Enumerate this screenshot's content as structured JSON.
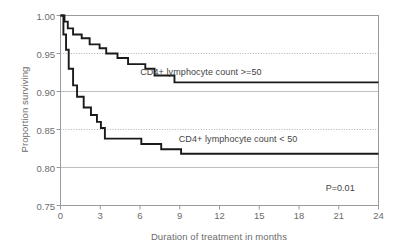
{
  "chart_data": {
    "type": "line",
    "subtype": "kaplan-meier-step",
    "title": "",
    "xlabel": "Duration of treatment in months",
    "ylabel": "Proportion surviving",
    "xlim": [
      0,
      24
    ],
    "ylim": [
      0.75,
      1.0
    ],
    "xticks": [
      0,
      3,
      6,
      9,
      12,
      15,
      18,
      21,
      24
    ],
    "xticklabels": [
      "0",
      "3",
      "6",
      "9",
      "12",
      "15",
      "18",
      "21",
      "24"
    ],
    "yticks": [
      0.75,
      0.8,
      0.85,
      0.9,
      0.95,
      1.0
    ],
    "yticklabels": [
      "0.75",
      "0.80",
      "0.85",
      "0.90",
      "0.95",
      "1.00"
    ],
    "grid": "horizontal-dotted",
    "legend_position": "inline-right-of-curve",
    "annotations": [
      {
        "name": "p-value",
        "text": "P=0.01",
        "x": 22.2,
        "y": 0.772
      }
    ],
    "series": [
      {
        "name": "CD4+ lymphocyte count >=50",
        "label": "CD4+ lymphocyte count >=50",
        "color": "#1a1a1a",
        "label_x": 10.6,
        "label_y": 0.925,
        "points": [
          [
            0.0,
            1.0
          ],
          [
            0.3,
            1.0
          ],
          [
            0.3,
            0.992
          ],
          [
            0.55,
            0.992
          ],
          [
            0.55,
            0.983
          ],
          [
            0.95,
            0.983
          ],
          [
            0.95,
            0.975
          ],
          [
            1.6,
            0.975
          ],
          [
            1.6,
            0.97
          ],
          [
            2.2,
            0.97
          ],
          [
            2.2,
            0.962
          ],
          [
            2.95,
            0.962
          ],
          [
            2.95,
            0.957
          ],
          [
            3.45,
            0.957
          ],
          [
            3.45,
            0.95
          ],
          [
            4.3,
            0.95
          ],
          [
            4.3,
            0.944
          ],
          [
            5.1,
            0.944
          ],
          [
            5.1,
            0.936
          ],
          [
            6.4,
            0.936
          ],
          [
            6.4,
            0.93
          ],
          [
            7.1,
            0.93
          ],
          [
            7.1,
            0.921
          ],
          [
            8.6,
            0.921
          ],
          [
            8.6,
            0.912
          ],
          [
            24.0,
            0.912
          ]
        ]
      },
      {
        "name": "CD4+ lymphocyte count < 50",
        "label": "CD4+ lymphocyte count < 50",
        "color": "#1a1a1a",
        "label_x": 13.4,
        "label_y": 0.836,
        "points": [
          [
            0.0,
            1.0
          ],
          [
            0.22,
            1.0
          ],
          [
            0.22,
            0.975
          ],
          [
            0.42,
            0.975
          ],
          [
            0.42,
            0.955
          ],
          [
            0.62,
            0.955
          ],
          [
            0.62,
            0.93
          ],
          [
            0.95,
            0.93
          ],
          [
            0.95,
            0.908
          ],
          [
            1.25,
            0.908
          ],
          [
            1.25,
            0.893
          ],
          [
            1.75,
            0.893
          ],
          [
            1.75,
            0.879
          ],
          [
            2.3,
            0.879
          ],
          [
            2.3,
            0.869
          ],
          [
            2.75,
            0.869
          ],
          [
            2.75,
            0.86
          ],
          [
            3.05,
            0.86
          ],
          [
            3.05,
            0.852
          ],
          [
            3.35,
            0.852
          ],
          [
            3.35,
            0.838
          ],
          [
            6.1,
            0.838
          ],
          [
            6.1,
            0.831
          ],
          [
            7.6,
            0.831
          ],
          [
            7.6,
            0.824
          ],
          [
            9.1,
            0.824
          ],
          [
            9.1,
            0.818
          ],
          [
            24.0,
            0.818
          ]
        ]
      }
    ]
  },
  "axes": {
    "y_label": "Proportion surviving",
    "x_label": "Duration of treatment in months"
  },
  "labels": {
    "series_high": "CD4+ lymphocyte count >=50",
    "series_low": "CD4+ lymphocyte count < 50",
    "pvalue": "P=0.01"
  }
}
